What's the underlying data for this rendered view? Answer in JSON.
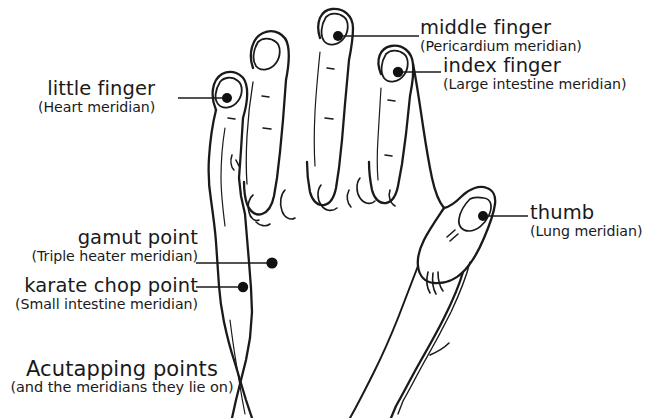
{
  "figure": {
    "title": "Acutapping points",
    "subtitle": "(and the meridians they lie on)",
    "background_color": "#ffffff",
    "ink_color": "#1a1a1a"
  },
  "caption": {
    "line1": "Acutapping points",
    "line2": "(and the meridians they lie on)"
  },
  "labels": [
    {
      "id": "little-finger",
      "name": "little finger",
      "meridian": "(Heart meridian)",
      "align": "right"
    },
    {
      "id": "middle-finger",
      "name": "middle finger",
      "meridian": "(Pericardium meridian)",
      "align": "left"
    },
    {
      "id": "index-finger",
      "name": "index finger",
      "meridian": "(Large intestine meridian)",
      "align": "left"
    },
    {
      "id": "thumb",
      "name": "thumb",
      "meridian": "(Lung meridian)",
      "align": "left"
    },
    {
      "id": "gamut-point",
      "name": "gamut point",
      "meridian": "(Triple heater meridian)",
      "align": "right"
    },
    {
      "id": "karate-chop-point",
      "name": "karate chop point",
      "meridian": "(Small intestine meridian)",
      "align": "right"
    }
  ],
  "acupoints": [
    {
      "id": "little-finger-point",
      "label": "little finger",
      "x": 227,
      "y": 98,
      "r": 5.0
    },
    {
      "id": "middle-finger-point",
      "label": "middle finger",
      "x": 338,
      "y": 36,
      "r": 5.0
    },
    {
      "id": "index-finger-point",
      "label": "index finger",
      "x": 398,
      "y": 72,
      "r": 5.2
    },
    {
      "id": "thumb-point",
      "label": "thumb",
      "x": 483,
      "y": 216,
      "r": 5.0
    },
    {
      "id": "gamut-point-dot",
      "label": "gamut point",
      "x": 272,
      "y": 263,
      "r": 5.6
    },
    {
      "id": "karate-chop-point-dot",
      "label": "karate chop point",
      "x": 243,
      "y": 287,
      "r": 5.2
    }
  ],
  "leader_lines": [
    {
      "id": "leader-little-finger",
      "x1": 178,
      "y1": 98,
      "x2": 227,
      "y2": 98
    },
    {
      "id": "leader-middle-finger",
      "x1": 338,
      "y1": 36,
      "x2": 419,
      "y2": 36
    },
    {
      "id": "leader-index-finger",
      "x1": 398,
      "y1": 72,
      "x2": 441,
      "y2": 72
    },
    {
      "id": "leader-thumb",
      "x1": 483,
      "y1": 216,
      "x2": 528,
      "y2": 216
    },
    {
      "id": "leader-gamut-point",
      "x1": 196,
      "y1": 263,
      "x2": 272,
      "y2": 263
    },
    {
      "id": "leader-karate-chop-point",
      "x1": 196,
      "y1": 287,
      "x2": 243,
      "y2": 287
    }
  ]
}
